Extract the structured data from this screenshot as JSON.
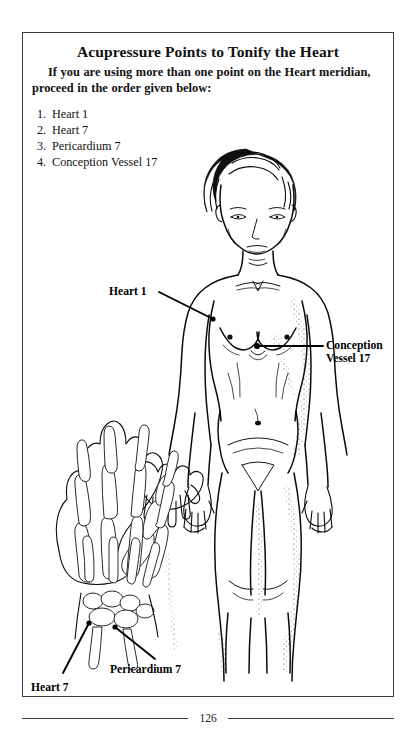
{
  "page": {
    "title": "Acupressure Points to Tonify the Heart",
    "intro": "If you are using more than one point on the Heart meridian, proceed in the order given below:",
    "page_number": "126",
    "ink_color": "#000000",
    "border_color": "#3a3a3a",
    "paper_color": "#ffffff"
  },
  "points": [
    {
      "num": "1.",
      "label": "Heart 1"
    },
    {
      "num": "2.",
      "label": "Heart 7"
    },
    {
      "num": "3.",
      "label": "Pericardium 7"
    },
    {
      "num": "4.",
      "label": "Conception Vessel 17"
    }
  ],
  "callouts": {
    "heart1": "Heart 1",
    "conception_vessel_17_line1": "Conception",
    "conception_vessel_17_line2": "Vessel 17",
    "pericardium7": "Pericardium 7",
    "heart7": "Heart 7"
  },
  "figures": {
    "body": {
      "name": "anatomical-female-figure",
      "description": "Front-facing line drawing of a standing nude female figure, cropped at the knees, with acupressure points marked"
    },
    "hand": {
      "name": "hand-skeleton-diagram",
      "description": "Line drawing of the bones of a left hand, palm view, with wrist acupressure points marked"
    },
    "hand_inset": {
      "name": "hand-silhouette-inset",
      "description": "Small outline drawing of a hand shown above the skeleton diagram"
    }
  }
}
